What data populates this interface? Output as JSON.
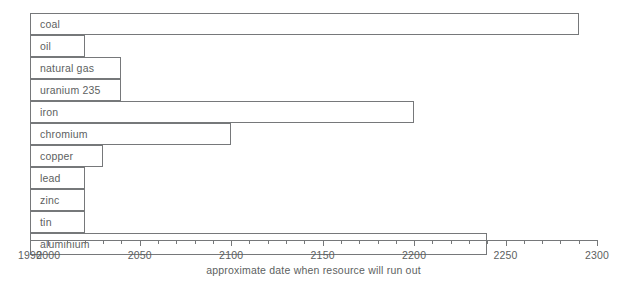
{
  "chart_data": {
    "type": "bar",
    "orientation": "horizontal",
    "title": "",
    "xlabel": "approximate date when resource will run out",
    "ylabel": "",
    "xlim": [
      1990,
      2300
    ],
    "x_start": 1990,
    "grid": false,
    "legend": "none",
    "tick_interval_minor": 10,
    "tick_interval_major": 50,
    "tick_labels": [
      "1990",
      "2000",
      "2050",
      "2100",
      "2150",
      "2200",
      "2250",
      "2300"
    ],
    "tick_label_values": [
      1990,
      2000,
      2050,
      2100,
      2150,
      2200,
      2250,
      2300
    ],
    "categories": [
      "coal",
      "oil",
      "natural gas",
      "uranium  235",
      "iron",
      "chromium",
      "copper",
      "lead",
      "zinc",
      "tin",
      "aluminium"
    ],
    "values": [
      2290,
      2020,
      2040,
      2040,
      2200,
      2100,
      2030,
      2020,
      2020,
      2020,
      2240
    ],
    "bars": [
      {
        "label": "coal",
        "end_year": 2290
      },
      {
        "label": "oil",
        "end_year": 2020
      },
      {
        "label": "natural gas",
        "end_year": 2040
      },
      {
        "label": "uranium  235",
        "end_year": 2040
      },
      {
        "label": "iron",
        "end_year": 2200
      },
      {
        "label": "chromium",
        "end_year": 2100
      },
      {
        "label": "copper",
        "end_year": 2030
      },
      {
        "label": "lead",
        "end_year": 2020
      },
      {
        "label": "zinc",
        "end_year": 2020
      },
      {
        "label": "tin",
        "end_year": 2020
      },
      {
        "label": "aluminium",
        "end_year": 2240
      }
    ],
    "colors": {
      "bar_fill": "#ffffff",
      "bar_stroke": "#76787a",
      "text": "#5d5f61",
      "axis": "#76787a",
      "background": "#ffffff"
    }
  }
}
